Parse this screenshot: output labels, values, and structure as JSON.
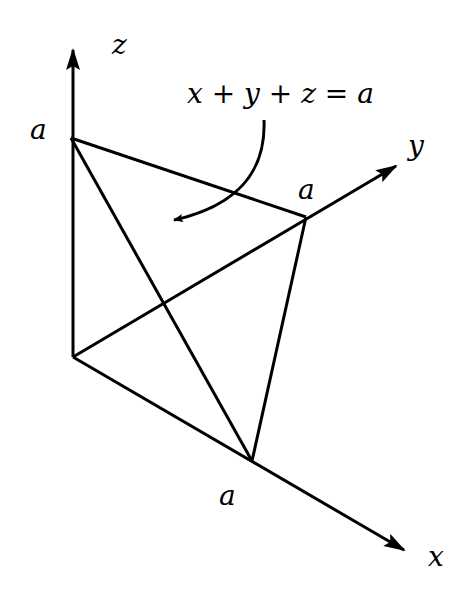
{
  "diagram": {
    "equation": "x + y + z = a",
    "axes": {
      "x": {
        "label": "x"
      },
      "y": {
        "label": "y"
      },
      "z": {
        "label": "z"
      }
    },
    "intercepts": {
      "x": {
        "label": "a"
      },
      "y": {
        "label": "a"
      },
      "z": {
        "label": "a"
      }
    },
    "line_color": "#000000",
    "background": "#ffffff"
  }
}
